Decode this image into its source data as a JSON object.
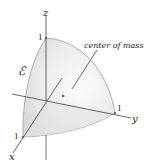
{
  "figure": {
    "region_label": "ℰ",
    "annotation": "center of mass",
    "axes": {
      "x": {
        "label": "x",
        "tick": "1"
      },
      "y": {
        "label": "y",
        "tick": "1"
      },
      "z": {
        "label": "z",
        "tick": "1"
      }
    },
    "colors": {
      "solid_fill": "#e9e9e9",
      "solid_edge": "#9a9a9a",
      "axis": "#555555",
      "text": "#222222"
    }
  }
}
